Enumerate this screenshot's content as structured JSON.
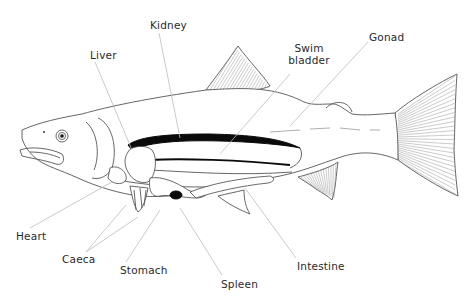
{
  "diagram": {
    "labels": {
      "kidney": "Kidney",
      "liver": "Liver",
      "swim_bladder_line1": "Swim",
      "swim_bladder_line2": "bladder",
      "gonad": "Gonad",
      "heart": "Heart",
      "caeca": "Caeca",
      "stomach": "Stomach",
      "spleen": "Spleen",
      "intestine": "Intestine"
    },
    "colors": {
      "outline": "#555555",
      "leader": "#bdbdbd",
      "organ_dark": "#0a0a0a",
      "label_text": "#2a2a2a",
      "background": "#ffffff"
    }
  }
}
